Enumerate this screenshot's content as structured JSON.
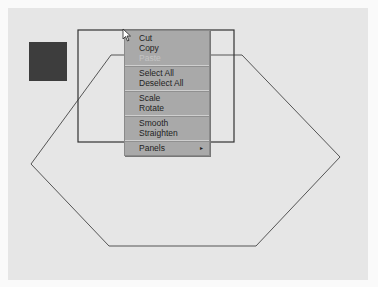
{
  "canvas": {
    "background": "#e6e6e6"
  },
  "swatch": {
    "color": "#3d3d3d"
  },
  "context_menu": {
    "groups": [
      {
        "items": [
          {
            "label": "Cut"
          },
          {
            "label": "Copy"
          },
          {
            "label": "Paste",
            "disabled": true
          }
        ]
      },
      {
        "items": [
          {
            "label": "Select All"
          },
          {
            "label": "Deselect All"
          }
        ]
      },
      {
        "items": [
          {
            "label": "Scale"
          },
          {
            "label": "Rotate"
          }
        ]
      },
      {
        "items": [
          {
            "label": "Smooth"
          },
          {
            "label": "Straighten"
          }
        ]
      },
      {
        "items": [
          {
            "label": "Panels",
            "submenu": true,
            "arrow": "▸"
          }
        ]
      }
    ]
  }
}
